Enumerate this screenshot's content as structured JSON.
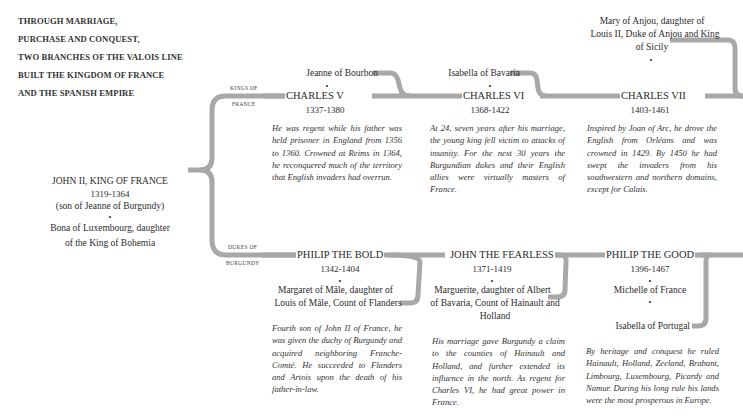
{
  "title_lines": [
    "THROUGH MARRIAGE,",
    "PURCHASE AND CONQUEST,",
    "TWO BRANCHES OF THE VALOIS LINE",
    "BUILT THE KINGDOM OF FRANCE",
    "AND THE SPANISH EMPIRE"
  ],
  "root": {
    "name": "JOHN II, KING OF FRANCE",
    "dates": "1319-1364",
    "note": "(son of Jeanne of Burgundy)",
    "spouse_line1": "Bona of Luxembourg, daughter",
    "spouse_line2": "of the King of Bohemia"
  },
  "branches": {
    "kings": {
      "label_line1": "KINGS OF",
      "label_line2": "FRANCE"
    },
    "dukes": {
      "label_line1": "DUKES OF",
      "label_line2": "BURGUNDY"
    }
  },
  "kings": [
    {
      "spouse": "Jeanne of Bourbon",
      "name": "CHARLES V",
      "dates": "1337-1380",
      "description": "He was regent while his father was held prisoner in England from 1356 to 1360. Crowned at Reims in 1364, he reconquered much of the territory that English invaders had overrun."
    },
    {
      "spouse": "Isabella of Bavaria",
      "name": "CHARLES VI",
      "dates": "1368-1422",
      "description": "At 24, seven years after his marriage, the young king fell victim to attacks of insanity. For the next 30 years the Burgundian dukes and their English allies were virtually masters of France."
    },
    {
      "spouse_line1": "Mary of Anjou, daughter of",
      "spouse_line2": "Louis II, Duke of Anjou and King",
      "spouse_line3": "of Sicily",
      "name": "CHARLES VII",
      "dates": "1403-1461",
      "description": "Inspired by Joan of Arc, he drove the English from Orléans and was crowned in 1429. By 1450 he had swept the invaders from his southwestern and northern domains, except for Calais."
    }
  ],
  "dukes": [
    {
      "name": "PHILIP THE BOLD",
      "dates": "1342-1404",
      "spouse_line1": "Margaret of Mâle, daughter of",
      "spouse_line2": "Louis of Mâle, Count of Flanders",
      "description": "Fourth son of John II of France, he was given the duchy of Burgundy and acquired neighboring Franche-Comté. He succeeded to Flanders and Artois upon the death of his father-in-law."
    },
    {
      "name": "JOHN THE FEARLESS",
      "dates": "1371-1419",
      "spouse_line1": "Marguerite, daughter of Albert",
      "spouse_line2": "of Bavaria, Count of Hainault and",
      "spouse_line3": "Holland",
      "description": "His marriage gave Burgundy a claim to the counties of Hainault and Holland, and further extended its influence in the north. As regent for Charles VI, he had great power in France."
    },
    {
      "name": "PHILIP THE GOOD",
      "dates": "1396-1467",
      "spouse1": "Michelle of France",
      "spouse2": "Isabella of Portugal",
      "description": "By heritage and conquest he ruled Hainault, Holland, Zeeland, Brabant, Limbourg, Luxembourg, Picardy and Namur. During his long rule his lands were the most prosperous in Europe."
    }
  ],
  "colors": {
    "connector": "#a8a8a8",
    "text": "#2a2a2a"
  }
}
